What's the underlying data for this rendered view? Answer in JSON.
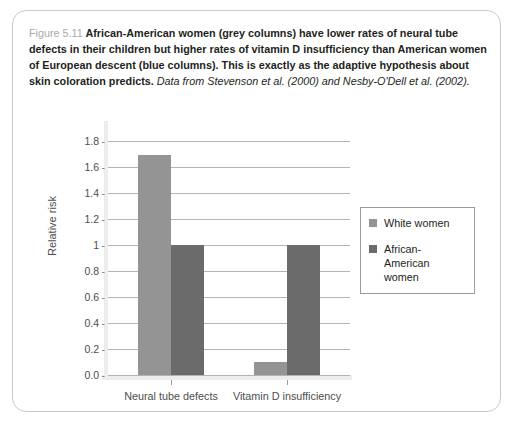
{
  "figure": {
    "number": "Figure 5.11",
    "caption_bold": "African-American women (grey columns) have lower rates of neural tube defects in their children but higher rates of vitamin D insufficiency than American women of European descent (blue columns). This is exactly as the adaptive hypothesis about skin coloration predicts.",
    "caption_source": "Data from Stevenson et al. (2000) and Nesby-O'Dell et al. (2002)."
  },
  "chart_data": {
    "type": "bar",
    "title": "",
    "xlabel": "",
    "ylabel": "Relative risk",
    "categories": [
      "Neural tube defects",
      "Vitamin D insufficiency"
    ],
    "series": [
      {
        "name": "White women",
        "values": [
          1.69,
          0.1
        ],
        "color": "#949494"
      },
      {
        "name": "African-American women",
        "values": [
          1.0,
          1.0
        ],
        "color": "#6b6b6b"
      }
    ],
    "ylim": [
      0,
      1.8
    ],
    "ytick_values": [
      0.0,
      0.2,
      0.4,
      0.6,
      0.8,
      1.0,
      1.2,
      1.4,
      1.6,
      1.8
    ],
    "ytick_labels": [
      "0.0",
      "0.2",
      "0.4",
      "0.6",
      "0.8",
      "1",
      "1.2",
      "1.4",
      "1.6",
      "1.8"
    ],
    "grid": true,
    "legend_position": "right"
  },
  "legend": {
    "entries": [
      {
        "label": "White women",
        "color": "#949494"
      },
      {
        "label": "African-American women",
        "color": "#6b6b6b"
      }
    ]
  }
}
